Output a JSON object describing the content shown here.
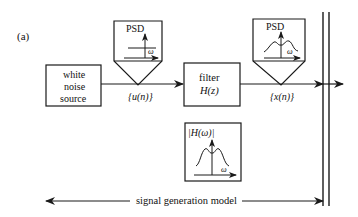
{
  "panel_label": "(a)",
  "blocks": {
    "source": {
      "line1": "white",
      "line2": "noise",
      "line3": "source"
    },
    "filter": {
      "line1": "filter",
      "line2": "H(z)"
    }
  },
  "signals": {
    "u": "{u(n)}",
    "x": "{x(n)}"
  },
  "psd_probes": [
    {
      "title": "PSD",
      "axis": "ω",
      "shape": "flat"
    },
    {
      "title": "PSD",
      "axis": "ω",
      "shape": "bimodal"
    }
  ],
  "response_box": {
    "title": "|H(ω)|",
    "axis": "ω",
    "shape": "bimodal"
  },
  "span_label": "signal generation model",
  "colors": {
    "stroke": "#1a1a1a",
    "background": "#ffffff"
  }
}
